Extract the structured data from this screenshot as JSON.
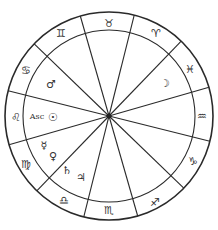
{
  "chart": {
    "center": {
      "x": 109,
      "y": 116
    },
    "outer_radius": 104,
    "inner_radius": 86,
    "hub_radius": 2.5,
    "spoke_offset_deg": 14,
    "spoke_count": 12,
    "stroke_color": "#2a2a2a"
  },
  "signs": [
    {
      "name": "taurus",
      "glyph": "♉",
      "x": 109,
      "y": 23
    },
    {
      "name": "aries",
      "glyph": "♈",
      "x": 156,
      "y": 33
    },
    {
      "name": "pisces",
      "glyph": "♓",
      "x": 190,
      "y": 69
    },
    {
      "name": "aquarius",
      "glyph": "♒",
      "x": 202,
      "y": 116
    },
    {
      "name": "capricorn",
      "glyph": "♑",
      "x": 193,
      "y": 161
    },
    {
      "name": "sagittarius",
      "glyph": "♐",
      "x": 155,
      "y": 202
    },
    {
      "name": "scorpio",
      "glyph": "♏",
      "x": 109,
      "y": 210
    },
    {
      "name": "libra",
      "glyph": "♎",
      "x": 64,
      "y": 200
    },
    {
      "name": "virgo",
      "glyph": "♍",
      "x": 26,
      "y": 164
    },
    {
      "name": "leo",
      "glyph": "♌",
      "x": 16,
      "y": 117
    },
    {
      "name": "cancer",
      "glyph": "♋",
      "x": 26,
      "y": 70
    },
    {
      "name": "gemini",
      "glyph": "♊",
      "x": 61,
      "y": 33
    }
  ],
  "planets": [
    {
      "name": "mars",
      "glyph": "♂",
      "x": 51,
      "y": 84
    },
    {
      "name": "moon",
      "glyph": "☽",
      "x": 165,
      "y": 83
    },
    {
      "name": "sun",
      "glyph": "☉",
      "x": 53,
      "y": 117
    },
    {
      "name": "mercury",
      "glyph": "☿",
      "x": 44,
      "y": 145
    },
    {
      "name": "venus",
      "glyph": "♀",
      "x": 53,
      "y": 156
    },
    {
      "name": "saturn",
      "glyph": "♄",
      "x": 67,
      "y": 170
    },
    {
      "name": "jupiter",
      "glyph": "♃",
      "x": 81,
      "y": 177
    }
  ],
  "ascendant": {
    "label": "Asc",
    "x": 37,
    "y": 117
  }
}
